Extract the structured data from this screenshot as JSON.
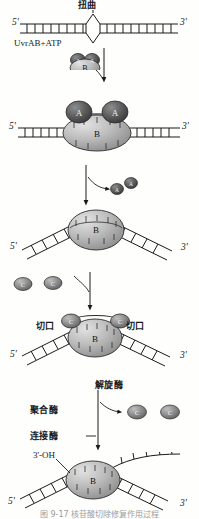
{
  "figure": {
    "title_cn": "核苷酸切除修复",
    "caption": "图 9-17   核苷酸切除修复作用过程",
    "width": 199,
    "height": 519
  },
  "colors": {
    "subunit_a": "#5a5a5a",
    "subunit_b": "#b8b8b8",
    "subunit_c": "#8a8a8a",
    "stroke": "#1a1a1a",
    "background": "#fefefd"
  },
  "panels": [
    {
      "id": "panel-1",
      "name": "damaged-dna-with-distortion",
      "labels": {
        "distortion": "扭曲",
        "enzyme": "UvrAB+ATP",
        "five_prime": "5'",
        "three_prime": "3'"
      }
    },
    {
      "id": "panel-2",
      "name": "uvrab-complex-bound",
      "labels": {
        "subunit_a_left": "A",
        "subunit_a_right": "A",
        "subunit_b": "B",
        "five_prime": "5'",
        "three_prime": "3'"
      }
    },
    {
      "id": "panel-3",
      "name": "uvrb-bends-dna",
      "labels": {
        "subunit_b": "B",
        "released_a_1": "A",
        "released_a_2": "A",
        "five_prime": "5'",
        "three_prime": "3'"
      }
    },
    {
      "id": "panel-4",
      "name": "uvrc-incision-nicks",
      "labels": {
        "subunit_b": "B",
        "subunit_c_left": "C",
        "subunit_c_right": "C",
        "free_c_1": "C",
        "free_c_2": "C",
        "nick_left": "切口",
        "nick_right": "切口",
        "five_prime": "5'",
        "three_prime": "3'"
      }
    },
    {
      "id": "panel-5",
      "name": "helicase-polymerase-ligase-step",
      "labels": {
        "helicase": "解旋酶",
        "polymerase": "聚合酶",
        "ligase": "连接酶",
        "released_c_1": "C",
        "released_c_2": "C"
      }
    },
    {
      "id": "panel-6",
      "name": "repair-synthesis-product",
      "labels": {
        "subunit_b": "B",
        "three_prime_oh": "3'-OH",
        "five_prime": "5'",
        "three_prime": "3'"
      }
    }
  ]
}
